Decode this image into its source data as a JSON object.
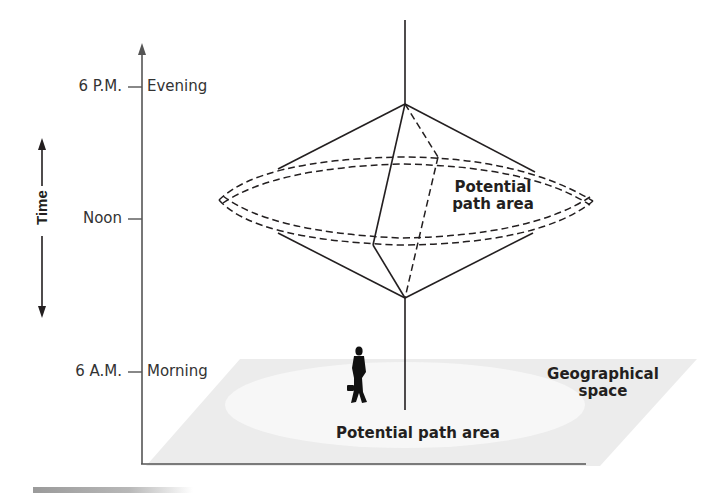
{
  "axis": {
    "time_label": "Time",
    "ticks": [
      {
        "left": "6 P.M.",
        "right": "Evening"
      },
      {
        "left": "Noon",
        "right": ""
      },
      {
        "left": "6 A.M.",
        "right": "Morning"
      }
    ]
  },
  "labels": {
    "prism_area": [
      "Potential",
      "path area"
    ],
    "ground_area": "Potential path area",
    "geo_space": [
      "Geographical",
      "space"
    ]
  },
  "colors": {
    "line": "#231f20",
    "axis": "#555555",
    "plane": "#ececec",
    "plane_ellipse": "#f6f6f6"
  }
}
